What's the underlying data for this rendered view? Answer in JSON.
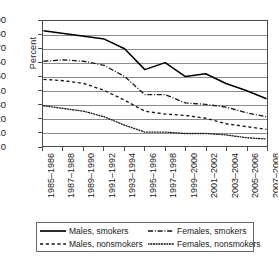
{
  "chart_data": {
    "type": "line",
    "title": "",
    "xlabel": "",
    "ylabel": "Percent",
    "ylim": [
      0,
      90
    ],
    "ytick_step": 10,
    "grid": "horizontal",
    "legend_position": "below-axis",
    "categories": [
      "1985–1986",
      "1987–1988",
      "1989–1990",
      "1991–1992",
      "1993–1994",
      "1995–1996",
      "1997–1998",
      "1999–2000",
      "2001–2002",
      "2003–2004",
      "2005–2006",
      "2007–2008"
    ],
    "yticks": [
      "0",
      "10",
      "20",
      "30",
      "40",
      "50",
      "60",
      "70",
      "80",
      "90"
    ],
    "series": [
      {
        "name": "Males, smokers",
        "style": "solid",
        "color": "#000000",
        "values": [
          83,
          81,
          79,
          77,
          70,
          55,
          60,
          50,
          52,
          45,
          40,
          34
        ]
      },
      {
        "name": "Females, smokers",
        "style": "dash-dot",
        "color": "#1a1a1a",
        "values": [
          61,
          62,
          61,
          58,
          50,
          37,
          37,
          31,
          30,
          28,
          24,
          21
        ]
      },
      {
        "name": "Males, nonsmokers",
        "style": "dashed",
        "color": "#1a1a1a",
        "values": [
          48,
          47,
          45,
          40,
          33,
          25,
          23,
          22,
          20,
          16,
          14,
          12
        ]
      },
      {
        "name": "Females, nonsmokers",
        "style": "dotted",
        "color": "#1a1a1a",
        "values": [
          29,
          27,
          25,
          21,
          15,
          10,
          10,
          9,
          9,
          8,
          6,
          5
        ]
      }
    ]
  },
  "legend": {
    "items": [
      {
        "label": "Males, smokers",
        "style": "solid"
      },
      {
        "label": "Females, smokers",
        "style": "dash-dot"
      },
      {
        "label": "Males, nonsmokers",
        "style": "dashed"
      },
      {
        "label": "Females, nonsmokers",
        "style": "dotted"
      }
    ]
  }
}
